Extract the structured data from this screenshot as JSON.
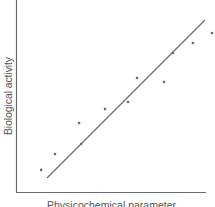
{
  "chart_data": {
    "type": "scatter",
    "title": "",
    "xlabel": "Physicochemical parameter",
    "ylabel": "Biological activity",
    "xlim": [
      0,
      10
    ],
    "ylim": [
      0,
      10
    ],
    "grid": false,
    "ticks": false,
    "legend": null,
    "series": [
      {
        "name": "observations",
        "type": "scatter",
        "x": [
          1.26,
          1.96,
          3.17,
          3.27,
          4.47,
          5.63,
          6.08,
          7.44,
          7.89,
          8.89,
          9.85
        ],
        "y": [
          1.15,
          1.98,
          3.59,
          2.5,
          4.32,
          4.69,
          5.94,
          5.73,
          7.24,
          7.76,
          8.28
        ]
      },
      {
        "name": "regression line",
        "type": "line",
        "x": [
          1.56,
          9.5
        ],
        "y": [
          0.73,
          8.96
        ]
      }
    ]
  },
  "colors": {
    "axis": "#6a6a6a",
    "points": "#6a6a6a",
    "line": "#6e6e6e",
    "text": "#555555"
  }
}
